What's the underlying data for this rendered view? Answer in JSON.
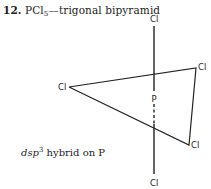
{
  "heading": {
    "number": "12.",
    "formula_main": "PCl",
    "formula_subscript": "5",
    "description": "—trigonal bipyramid"
  },
  "diagram": {
    "central_atom": "P",
    "ligands": {
      "axial_top": "Cl",
      "axial_bottom": "Cl",
      "equatorial_left": "Cl",
      "equatorial_right_top": "Cl",
      "equatorial_right_bottom": "Cl"
    }
  },
  "caption": {
    "hybrid_prefix": "dsp",
    "hybrid_superscript": "3",
    "hybrid_suffix": " hybrid on P"
  }
}
